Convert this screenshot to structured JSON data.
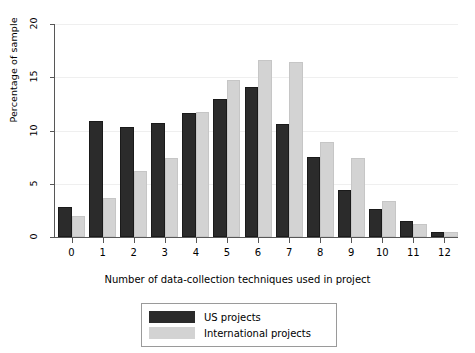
{
  "chart_data": {
    "type": "bar",
    "title": "",
    "xlabel": "Number of data-collection techniques used in project",
    "ylabel": "Percentage of sample",
    "categories": [
      "0",
      "1",
      "2",
      "3",
      "4",
      "5",
      "6",
      "7",
      "8",
      "9",
      "10",
      "11",
      "12"
    ],
    "series": [
      {
        "name": "US projects",
        "color": "#2b2b2b",
        "values": [
          2.8,
          10.9,
          10.3,
          10.7,
          11.6,
          13.0,
          14.1,
          10.6,
          7.5,
          4.4,
          2.6,
          1.5,
          0.5
        ]
      },
      {
        "name": "International projects",
        "color": "#d3d3d3",
        "values": [
          2.0,
          3.7,
          6.2,
          7.4,
          11.7,
          14.7,
          16.6,
          16.4,
          8.9,
          7.4,
          3.4,
          1.2,
          0.5
        ]
      }
    ],
    "ylim": [
      0,
      20
    ],
    "yticks": [
      "0",
      "5",
      "10",
      "15",
      "20"
    ],
    "ytick_values": [
      0,
      5,
      10,
      15,
      20
    ],
    "grid": "horizontal",
    "legend_position": "bottom-center"
  },
  "legend": {
    "entries": [
      {
        "label": "US projects",
        "swatch": "us"
      },
      {
        "label": "International projects",
        "swatch": "intl"
      }
    ]
  }
}
